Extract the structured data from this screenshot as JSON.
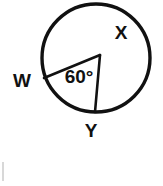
{
  "figure": {
    "kind": "circle-central-angle-diagram",
    "background_color": "#ffffff",
    "stroke_color": "#111111",
    "circle": {
      "center_x": 96,
      "center_y": 58,
      "radius": 54,
      "stroke_width": 3.4
    },
    "vertex": {
      "x": 100,
      "y": 55
    },
    "radii": [
      {
        "name": "radius-to-W",
        "from_x": 100,
        "from_y": 55,
        "to_x": 44,
        "to_y": 78
      },
      {
        "name": "radius-to-Y",
        "from_x": 100,
        "from_y": 55,
        "to_x": 95,
        "to_y": 112
      }
    ],
    "labels": {
      "angle": {
        "text": "60°",
        "value": 60,
        "unit": "degrees",
        "x": 79,
        "y": 78
      },
      "point_w": {
        "text": "W",
        "x": 22,
        "y": 82
      },
      "point_x": {
        "text": "X",
        "x": 121,
        "y": 34
      },
      "point_y": {
        "text": "Y",
        "x": 91,
        "y": 132
      }
    }
  }
}
